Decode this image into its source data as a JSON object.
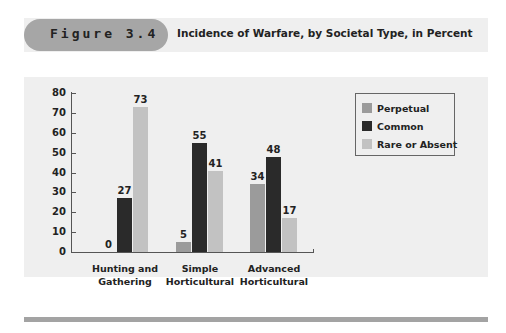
{
  "header": {
    "figure_label": "Figure 3.4",
    "title": "Incidence of Warfare, by Societal Type, in Percent"
  },
  "colors": {
    "perpetual": "#9b9b9b",
    "common": "#2a2a2a",
    "rare": "#c2c2c2",
    "panel": "#efefef",
    "pill": "#a6a6a6"
  },
  "chart_data": {
    "type": "bar",
    "title": "Incidence of Warfare, by Societal Type, in Percent",
    "xlabel": "",
    "ylabel": "",
    "ylim": [
      0,
      80
    ],
    "yticks": [
      0,
      10,
      20,
      30,
      40,
      50,
      60,
      70,
      80
    ],
    "categories": [
      "Hunting and Gathering",
      "Simple Horticultural",
      "Advanced Horticultural"
    ],
    "series": [
      {
        "name": "Perpetual",
        "values": [
          0,
          5,
          34
        ]
      },
      {
        "name": "Common",
        "values": [
          27,
          55,
          48
        ]
      },
      {
        "name": "Rare or Absent",
        "values": [
          73,
          41,
          17
        ]
      }
    ],
    "legend_position": "right",
    "grid": false
  },
  "legend": {
    "items": [
      "Perpetual",
      "Common",
      "Rare or Absent"
    ]
  },
  "categories_display": [
    {
      "line1": "Hunting and",
      "line2": "Gathering"
    },
    {
      "line1": "Simple",
      "line2": "Horticultural"
    },
    {
      "line1": "Advanced",
      "line2": "Horticultural"
    }
  ]
}
